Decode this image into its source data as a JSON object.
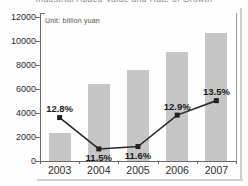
{
  "title": "Industrial Added Value and Rate of Growth",
  "unit_label": "Unit: billion yuan",
  "chart_data": {
    "type": "bar",
    "subtype": "bar-with-line-overlay",
    "title": "Industrial Added Value and Rate of Growth",
    "unit": "billion yuan",
    "categories": [
      "2003",
      "2004",
      "2005",
      "2006",
      "2007"
    ],
    "series": [
      {
        "name": "Industrial added value",
        "type": "bar",
        "values": [
          2300,
          6400,
          7600,
          9100,
          10700
        ],
        "color": "#c6c6c6",
        "axis": "left"
      },
      {
        "name": "Rate of growth",
        "type": "line",
        "values": [
          12.8,
          11.5,
          11.6,
          12.9,
          13.5
        ],
        "point_labels": [
          "12.8%",
          "11.5%",
          "11.6%",
          "12.9%",
          "13.5%"
        ],
        "label_positions": [
          "above",
          "below",
          "below",
          "above",
          "above"
        ],
        "color": "#2b2b2b",
        "marker": "square",
        "axis": "right-unlabeled"
      }
    ],
    "xlabel": "",
    "ylabel": "",
    "ylim": [
      0,
      12000
    ],
    "ytick_step": 2000,
    "yticks": [
      "0",
      "2000",
      "4000",
      "6000",
      "8000",
      "10000",
      "12000"
    ],
    "grid": false,
    "legend_position": "none"
  }
}
